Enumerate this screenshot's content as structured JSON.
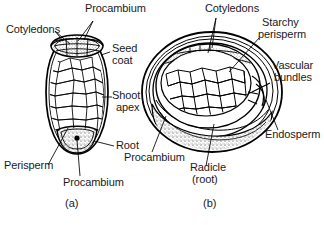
{
  "figure": {
    "background_color": "#ffffff",
    "ink_color": "#000000",
    "panels": [
      {
        "id": "a",
        "caption": "(a)",
        "shape": "elongate-oval longitudinal section",
        "labels": [
          "Cotyledons",
          "Procambium",
          "Seed coat",
          "Shoot apex",
          "Root",
          "Procambium",
          "Perisperm"
        ]
      },
      {
        "id": "b",
        "caption": "(b)",
        "shape": "rounded oval section with concentric rings",
        "labels": [
          "Cotyledons",
          "Starchy perisperm",
          "Vascular bundles",
          "Endosperm",
          "Radicle (root)",
          "Procambium"
        ]
      }
    ]
  },
  "panel_a": {
    "caption": "(a)",
    "label_cotyledons": "Cotyledons",
    "label_procambium_top": "Procambium",
    "label_seed_coat_line1": "Seed",
    "label_seed_coat_line2": "coat",
    "label_shoot_apex_line1": "Shoot",
    "label_shoot_apex_line2": "apex",
    "label_root": "Root",
    "label_procambium_bottom": "Procambium",
    "label_perisperm": "Perisperm"
  },
  "panel_b": {
    "caption": "(b)",
    "label_cotyledons": "Cotyledons",
    "label_starchy_line1": "Starchy",
    "label_starchy_line2": "perisperm",
    "label_vascular_line1": "Vascular",
    "label_vascular_line2": "bundles",
    "label_endosperm": "Endosperm",
    "label_radicle_line1": "Radicle",
    "label_radicle_line2": "(root)",
    "label_procambium": "Procambium"
  }
}
